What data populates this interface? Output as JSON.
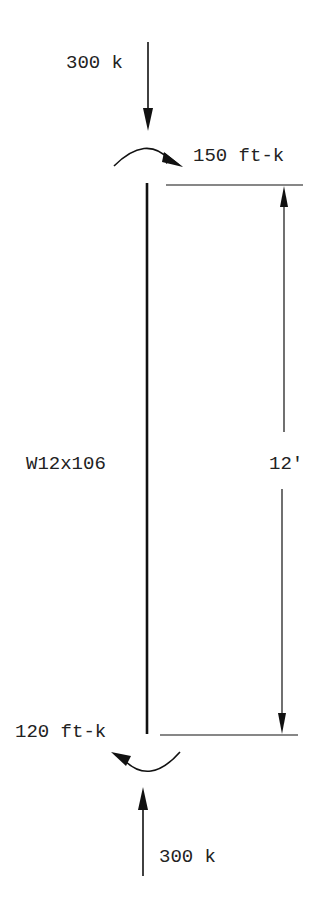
{
  "diagram": {
    "type": "beam-column free body diagram",
    "member": {
      "label": "W12x106",
      "length_label": "12'"
    },
    "top_axial_load": {
      "label": "300 k",
      "direction": "down"
    },
    "top_moment": {
      "label": "150 ft-k",
      "direction": "clockwise"
    },
    "bottom_moment": {
      "label": "120 ft-k",
      "direction": "counterclockwise"
    },
    "bottom_axial_load": {
      "label": "300 k",
      "direction": "up"
    },
    "colors": {
      "line": "#111111",
      "text": "#222222",
      "background": "#ffffff"
    }
  }
}
